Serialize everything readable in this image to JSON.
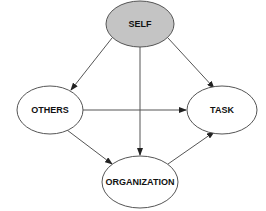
{
  "diagram": {
    "type": "directed-graph",
    "nodes": [
      {
        "id": "self",
        "label": "SELF",
        "fill": "#c4c4c4"
      },
      {
        "id": "others",
        "label": "OTHERS",
        "fill": "#ffffff"
      },
      {
        "id": "task",
        "label": "TASK",
        "fill": "#ffffff"
      },
      {
        "id": "organization",
        "label": "ORGANIZATION",
        "fill": "#ffffff"
      }
    ],
    "edges": [
      {
        "from": "SELF",
        "to": "OTHERS"
      },
      {
        "from": "SELF",
        "to": "TASK"
      },
      {
        "from": "SELF",
        "to": "ORGANIZATION"
      },
      {
        "from": "OTHERS",
        "to": "TASK"
      },
      {
        "from": "OTHERS",
        "to": "ORGANIZATION"
      },
      {
        "from": "ORGANIZATION",
        "to": "TASK"
      }
    ],
    "colors": {
      "stroke": "#555555",
      "self_fill": "#c4c4c4",
      "node_fill": "#ffffff"
    }
  }
}
